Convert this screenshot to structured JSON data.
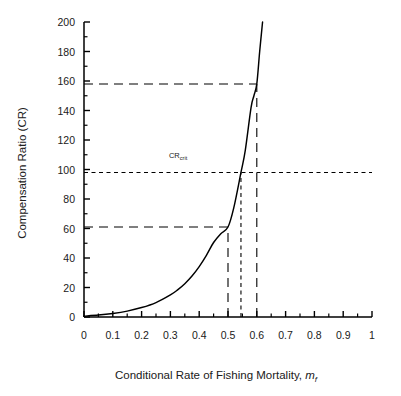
{
  "chart_data": {
    "type": "line",
    "title": "",
    "xlabel": "Conditional Rate of Fishing Mortality, m",
    "xlabel_sub": "f",
    "ylabel": "Compensation Ratio (CR)",
    "xlim": [
      0,
      1
    ],
    "ylim": [
      0,
      200
    ],
    "grid": false,
    "legend": null,
    "x_ticks": [
      "0",
      "0.1",
      "0.2",
      "0.3",
      "0.4",
      "0.5",
      "0.6",
      "0.7",
      "0.8",
      "0.9",
      "1"
    ],
    "x_tick_values": [
      0,
      0.1,
      0.2,
      0.3,
      0.4,
      0.5,
      0.6,
      0.7,
      0.8,
      0.9,
      1
    ],
    "y_ticks": [
      "0",
      "20",
      "40",
      "60",
      "80",
      "100",
      "120",
      "140",
      "160",
      "180",
      "200"
    ],
    "y_tick_values": [
      0,
      20,
      40,
      60,
      80,
      100,
      120,
      140,
      160,
      180,
      200
    ],
    "y_minor_step": 10,
    "series": [
      {
        "name": "Compensation Ratio curve",
        "x": [
          0.0,
          0.05,
          0.1,
          0.15,
          0.2,
          0.25,
          0.3,
          0.325,
          0.35,
          0.375,
          0.4,
          0.425,
          0.45,
          0.475,
          0.5,
          0.52,
          0.545,
          0.56,
          0.58,
          0.59,
          0.6,
          0.61,
          0.62
        ],
        "values": [
          0.6,
          1.3,
          2.4,
          4.0,
          6.4,
          9.8,
          15.0,
          18.4,
          22.6,
          27.8,
          34.2,
          41.8,
          50.5,
          56.5,
          61.0,
          74.0,
          98.0,
          113.0,
          142.0,
          150.0,
          158.0,
          180.0,
          200.0
        ]
      }
    ],
    "annotations": [
      {
        "name": "cr-crit-label",
        "text": "CR",
        "subscript": "crit",
        "x": 0.295,
        "y": 108
      }
    ],
    "reference_lines": [
      {
        "name": "cr-upper-horizontal",
        "orientation": "horizontal",
        "value": 158,
        "x_start": 0,
        "x_end": 0.6,
        "dash": "long"
      },
      {
        "name": "cr-crit-horizontal",
        "orientation": "horizontal",
        "value": 98,
        "x_start": 0,
        "x_end": 1.0,
        "dash": "short"
      },
      {
        "name": "cr-lower-horizontal",
        "orientation": "horizontal",
        "value": 61,
        "x_start": 0,
        "x_end": 0.5,
        "dash": "long"
      },
      {
        "name": "mf-lower-vertical",
        "orientation": "vertical",
        "value": 0.5,
        "y_start": 0,
        "y_end": 61,
        "dash": "long"
      },
      {
        "name": "mf-crit-vertical",
        "orientation": "vertical",
        "value": 0.545,
        "y_start": 0,
        "y_end": 98,
        "dash": "short"
      },
      {
        "name": "mf-upper-vertical",
        "orientation": "vertical",
        "value": 0.6,
        "y_start": 0,
        "y_end": 158,
        "dash": "long"
      }
    ],
    "colors": {
      "curve": "#000000",
      "axis": "#000000",
      "reference": "#000000",
      "background": "#ffffff"
    }
  }
}
